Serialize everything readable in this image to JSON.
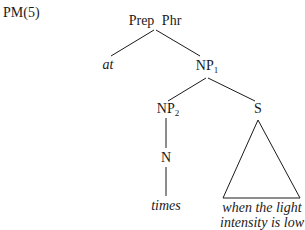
{
  "diagram": {
    "label": "PM(5)",
    "nodes": {
      "root": "Prep Phr",
      "at": "at",
      "np1": "NP",
      "np1_sub": "1",
      "np2": "NP",
      "np2_sub": "2",
      "s": "S",
      "n": "N",
      "times": "times",
      "s_text_line1": "when the light",
      "s_text_line2": "intensity is low"
    },
    "edges": [
      [
        "Prep Phr",
        "at"
      ],
      [
        "Prep Phr",
        "NP1"
      ],
      [
        "NP1",
        "NP2"
      ],
      [
        "NP1",
        "S"
      ],
      [
        "NP2",
        "N"
      ],
      [
        "N",
        "times"
      ],
      [
        "S",
        "triangle: when the light intensity is low"
      ]
    ]
  }
}
